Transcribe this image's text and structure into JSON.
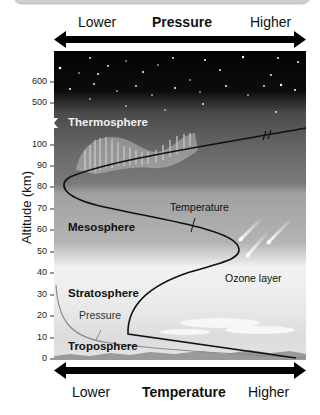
{
  "top_axis": {
    "left": "Lower",
    "title": "Pressure",
    "right": "Higher"
  },
  "bottom_axis": {
    "left": "Lower",
    "title": "Temperature",
    "right": "Higher"
  },
  "y_axis": {
    "label": "Altitude (km)",
    "ticks": [
      "600",
      "500",
      "100",
      "90",
      "80",
      "70",
      "60",
      "50",
      "40",
      "30",
      "20",
      "10",
      "0"
    ]
  },
  "layers": {
    "thermosphere": "Thermosphere",
    "mesosphere": "Mesosphere",
    "stratosphere": "Stratosphere",
    "troposphere": "Troposphere"
  },
  "annotations": {
    "temperature": "Temperature",
    "pressure": "Pressure",
    "ozone": "Ozone layer"
  },
  "colors": {
    "space": "#050505",
    "thermosphere": "#707070",
    "mesosphere": "#a8a8a8",
    "stratosphere": "#e6e6e6",
    "curve": "#111111",
    "pressure_curve": "#888888"
  }
}
